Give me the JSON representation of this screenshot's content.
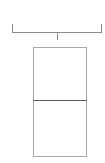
{
  "diagram": {
    "type": "bracket-over-stacked-boxes",
    "bracket": {
      "label": "",
      "color": "#8a8a8a"
    },
    "stack": {
      "border_color": "#a8a8a8",
      "divider_color": "#5e5e5e",
      "cells": [
        {
          "label": ""
        },
        {
          "label": ""
        }
      ]
    }
  }
}
